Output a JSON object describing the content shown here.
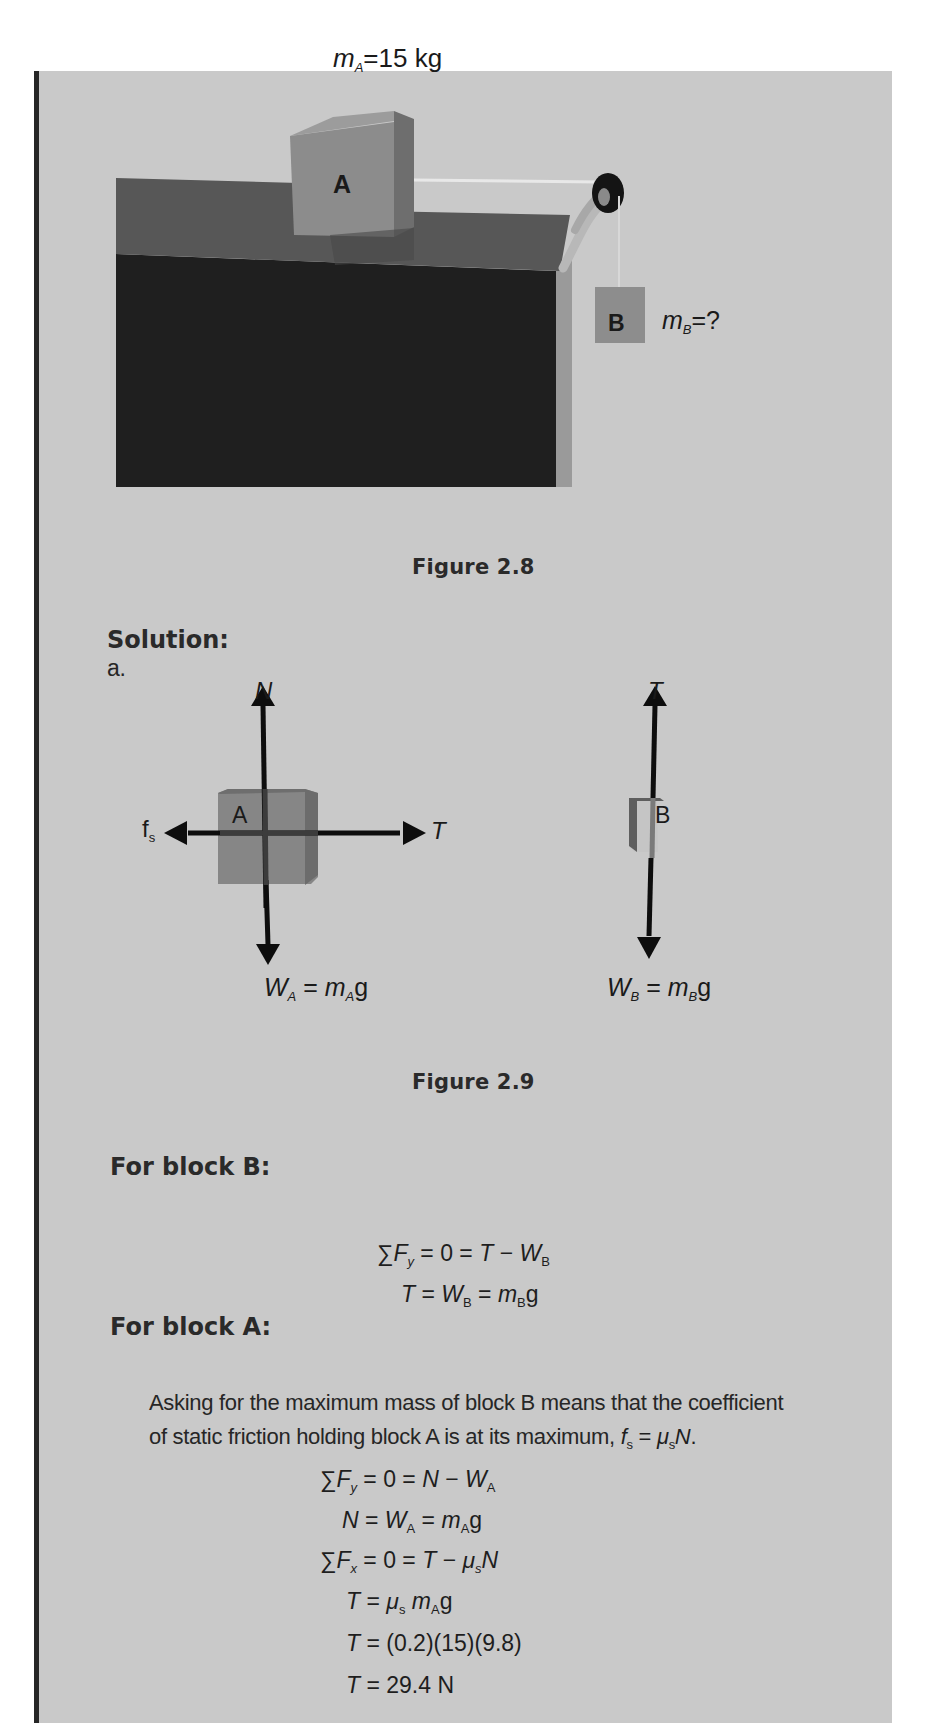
{
  "figure_2_8": {
    "caption": "Figure 2.8",
    "label_mass_a": {
      "symbol": "m",
      "subscript": "A",
      "value": "=15 kg"
    },
    "label_mass_b": {
      "symbol": "m",
      "subscript": "B",
      "value": "=?"
    },
    "block_a_label": "A",
    "block_b_label": "B"
  },
  "solution": {
    "heading": "Solution:",
    "part": "a."
  },
  "figure_2_9": {
    "caption": "Figure 2.9",
    "block_a": {
      "label": "A",
      "force_up": "N",
      "force_left": {
        "symbol": "f",
        "subscript": "s"
      },
      "force_right": "T",
      "force_down": {
        "lhs": "W",
        "lhs_sub": "A",
        "eq": " = ",
        "rhs": "m",
        "rhs_sub": "A",
        "tail": "g"
      }
    },
    "block_b": {
      "label": "B",
      "force_up": "T",
      "force_down": {
        "lhs": "W",
        "lhs_sub": "B",
        "eq": " = ",
        "rhs": "m",
        "rhs_sub": "B",
        "tail": "g"
      }
    }
  },
  "block_b_section": {
    "heading": "For block B:",
    "equations": [
      "∑F_y = 0 = T − W_B",
      "T = W_B = m_B g"
    ]
  },
  "block_a_section": {
    "heading": "For block A:",
    "paragraph_line1": "Asking for the maximum mass of block B means that the coefficient",
    "paragraph_line2": "of static friction holding block A is at its maximum, ",
    "paragraph_formula": "f_s = μ_s N.",
    "equations": [
      "∑F_y = 0 = N − W_A",
      "N = W_A = m_A g",
      "∑F_x = 0 = T − μ_s N",
      "T = μ_s m_A g",
      "T = (0.2)(15)(9.8)",
      "T = 29.4 N"
    ]
  },
  "colors": {
    "panel_bg": "#c9c9c9",
    "panel_border": "#262626",
    "block_face": "#8a8a8a",
    "table_top": "#585858",
    "table_front": "#202020"
  }
}
